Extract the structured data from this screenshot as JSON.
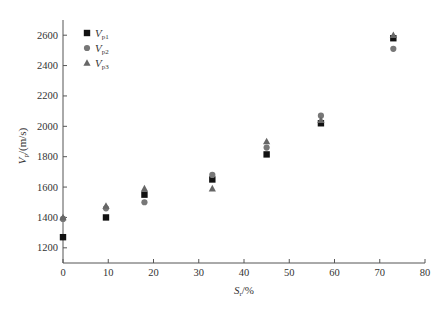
{
  "chart_data": {
    "type": "scatter",
    "title": "",
    "xlabel": "S_r/%",
    "ylabel": "V_p/(m/s)",
    "xlim": [
      0,
      80
    ],
    "ylim": [
      1100,
      2700
    ],
    "xticks": [
      0,
      10,
      20,
      30,
      40,
      50,
      60,
      70,
      80
    ],
    "yticks": [
      1200,
      1400,
      1600,
      1800,
      2000,
      2200,
      2400,
      2600
    ],
    "grid": false,
    "legend_position": "upper-left",
    "x": [
      0,
      9.5,
      18,
      33,
      45,
      57,
      73
    ],
    "series": [
      {
        "name": "V_p1",
        "marker": "square",
        "color": "#111111",
        "values": [
          1270,
          1400,
          1550,
          1650,
          1815,
          2020,
          2580
        ]
      },
      {
        "name": "V_p2",
        "marker": "circle",
        "color": "#777777",
        "values": [
          1390,
          1460,
          1500,
          1680,
          1860,
          2070,
          2510
        ]
      },
      {
        "name": "V_p3",
        "marker": "triangle",
        "color": "#666666",
        "values": [
          1400,
          1475,
          1590,
          1590,
          1900,
          2040,
          2600
        ]
      }
    ]
  },
  "labels": {
    "xlabel_main": "S",
    "xlabel_sub": "r",
    "xlabel_rest": "/%",
    "ylabel_main": "V",
    "ylabel_sub": "p",
    "ylabel_rest": "/(m/s)",
    "legend": [
      {
        "main": "V",
        "sub": "p1"
      },
      {
        "main": "V",
        "sub": "p2"
      },
      {
        "main": "V",
        "sub": "p3"
      }
    ]
  }
}
